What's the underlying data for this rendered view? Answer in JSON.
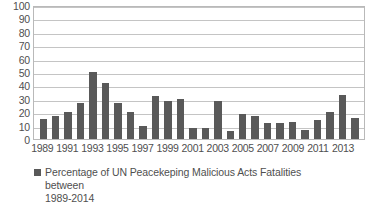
{
  "chart_data": {
    "type": "bar",
    "title": "",
    "xlabel": "",
    "ylabel": "",
    "ylim": [
      0,
      100
    ],
    "ytick_step": 10,
    "yticks": [
      100,
      90,
      80,
      70,
      60,
      50,
      40,
      30,
      20,
      10,
      0
    ],
    "grid": "horizontal",
    "legend_position": "bottom-center",
    "legend": [
      "Percentage of UN Peacekeping Malicious Acts Fatalities between 1989-2014"
    ],
    "bar_color": "#595959",
    "gridline_color": "#c4c4c4",
    "plot_border_color": "#b9b9b9",
    "categories": [
      "1989",
      "1990",
      "1991",
      "1992",
      "1993",
      "1994",
      "1995",
      "1996",
      "1997",
      "1998",
      "1999",
      "2000",
      "2001",
      "2002",
      "2003",
      "2004",
      "2005",
      "2006",
      "2007",
      "2008",
      "2009",
      "2010",
      "2011",
      "2012",
      "2013",
      "2014"
    ],
    "xtick_labels": [
      "1989",
      "",
      "1991",
      "",
      "1993",
      "",
      "1995",
      "",
      "1997",
      "",
      "1999",
      "",
      "2001",
      "",
      "2003",
      "",
      "2005",
      "",
      "2007",
      "",
      "2009",
      "",
      "2011",
      "",
      "2013",
      ""
    ],
    "series": [
      {
        "name": "Percentage of UN Peacekeping Malicious Acts Fatalities between 1989-2014",
        "values": [
          15,
          17,
          20,
          27,
          50,
          42,
          27,
          20,
          10,
          32,
          28,
          30,
          8,
          8,
          28,
          6,
          19,
          17.5,
          12,
          12,
          13,
          6.5,
          14,
          20.5,
          33,
          15.5
        ]
      }
    ]
  },
  "legend": {
    "line1": "Percentage of UN Peacekeping Malicious Acts Fatalities between",
    "line2": "1989-2014",
    "marker": "legend-swatch"
  }
}
